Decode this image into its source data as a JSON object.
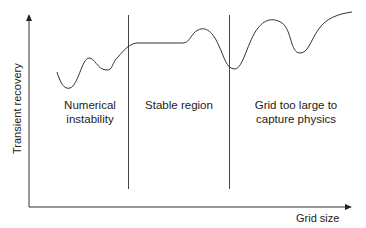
{
  "diagram": {
    "type": "conceptual-curve",
    "axes": {
      "y_label": "Transient recovery",
      "x_label": "Grid size"
    },
    "regions": [
      {
        "line1": "Numerical",
        "line2": "instability"
      },
      {
        "line1": "Stable region",
        "line2": ""
      },
      {
        "line1": "Grid too large to",
        "line2": "capture physics"
      }
    ],
    "colors": {
      "line": "#333333",
      "text": "#222222",
      "background": "#ffffff"
    }
  }
}
